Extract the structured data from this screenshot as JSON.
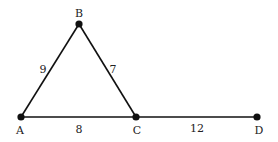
{
  "diagram": {
    "type": "geometry",
    "stroke_color": "#111111",
    "points": [
      {
        "name": "A",
        "x": 21,
        "y": 117,
        "label_x": 20,
        "label_y": 134
      },
      {
        "name": "B",
        "x": 79,
        "y": 24,
        "label_x": 79,
        "label_y": 17
      },
      {
        "name": "C",
        "x": 136,
        "y": 117,
        "label_x": 137,
        "label_y": 134
      },
      {
        "name": "D",
        "x": 257,
        "y": 117,
        "label_x": 259,
        "label_y": 134
      }
    ],
    "segments": [
      {
        "from": "A",
        "to": "B",
        "length": "9",
        "label_x": 43,
        "label_y": 73
      },
      {
        "from": "B",
        "to": "C",
        "length": "7",
        "label_x": 113,
        "label_y": 73
      },
      {
        "from": "A",
        "to": "C",
        "length": "8",
        "label_x": 79,
        "label_y": 133
      },
      {
        "from": "C",
        "to": "D",
        "length": "12",
        "label_x": 197,
        "label_y": 132
      }
    ]
  }
}
